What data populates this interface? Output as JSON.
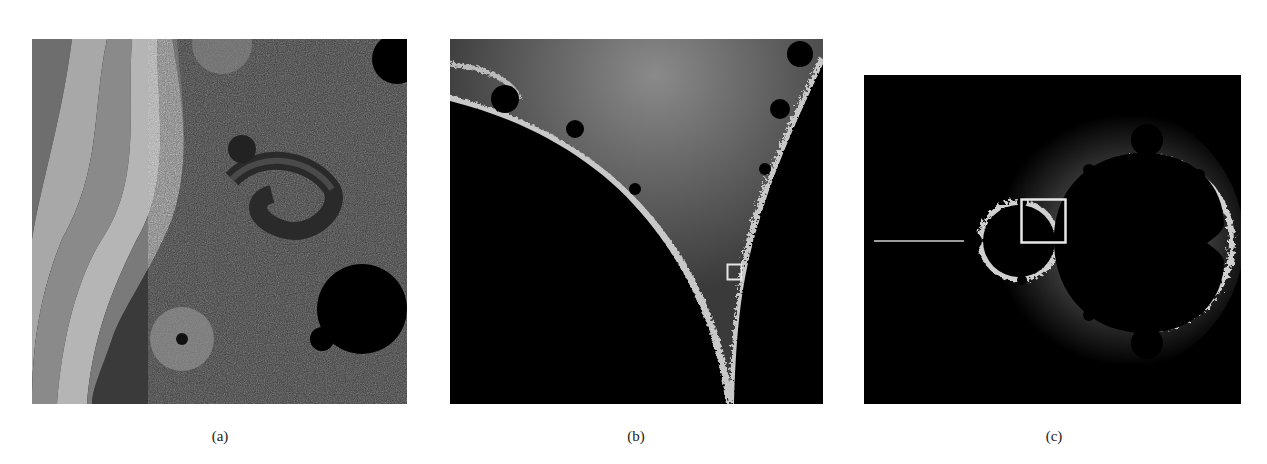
{
  "figure": {
    "panels": [
      {
        "id": "a",
        "caption": "(a)",
        "description": "Deep zoom of Mandelbrot set boundary with banded escape-time coloring, spirals and a dark minibrot"
      },
      {
        "id": "b",
        "caption": "(b)",
        "description": "Zoom into the cusp/seahorse valley region between main cardioid and period-2 bulb, with a small white selection box"
      },
      {
        "id": "c",
        "caption": "(c)",
        "description": "Full Mandelbrot set view with white selection box over the seahorse valley"
      }
    ]
  },
  "colors": {
    "background": "#ffffff",
    "set_interior": "#000000",
    "boundary": "#d8d8d8",
    "selection_box": "#e6e6e6"
  }
}
